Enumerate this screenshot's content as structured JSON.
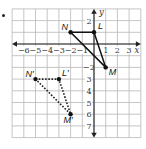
{
  "figure": {
    "bullet": "•",
    "grid": {
      "xmin": -7,
      "xmax": 4,
      "ymin": -8,
      "ymax": 3,
      "unit_px": 11.7,
      "origin_px": [
        94,
        44
      ]
    },
    "axes": {
      "x_label": "x",
      "y_label": "y",
      "x_ticks": [
        {
          "v": -6,
          "t": "−6"
        },
        {
          "v": -5,
          "t": "−5"
        },
        {
          "v": -4,
          "t": "−4"
        },
        {
          "v": -3,
          "t": "−3"
        },
        {
          "v": -2,
          "t": "−2"
        },
        {
          "v": -1,
          "t": "−1"
        },
        {
          "v": 1,
          "t": "1"
        },
        {
          "v": 2,
          "t": "2"
        },
        {
          "v": 3,
          "t": "3"
        }
      ],
      "y_ticks": [
        {
          "v": 2,
          "t": "2"
        },
        {
          "v": -2,
          "t": "−2"
        },
        {
          "v": -3,
          "t": "3"
        },
        {
          "v": -4,
          "t": "4"
        },
        {
          "v": -5,
          "t": "5"
        },
        {
          "v": -6,
          "t": "6"
        },
        {
          "v": -7,
          "t": "7"
        }
      ]
    },
    "original_triangle": {
      "style": "solid",
      "points": [
        {
          "label": "N",
          "x": -2,
          "y": 1
        },
        {
          "label": "L",
          "x": 0,
          "y": 1
        },
        {
          "label": "M",
          "x": 1,
          "y": -2
        }
      ]
    },
    "image_triangle": {
      "style": "dashed",
      "points": [
        {
          "label": "N′",
          "x": -5,
          "y": -3
        },
        {
          "label": "L′",
          "x": -3,
          "y": -3
        },
        {
          "label": "M′",
          "x": -2,
          "y": -6
        }
      ]
    },
    "colors": {
      "grid": "#b8b8b8",
      "axis": "#222222",
      "solid": "#111111",
      "dashed": "#222222"
    }
  }
}
